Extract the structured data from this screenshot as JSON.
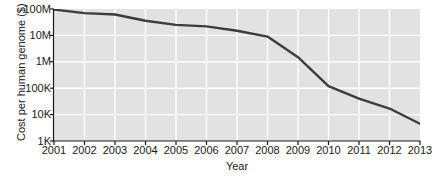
{
  "chart_data": {
    "type": "line",
    "title": "",
    "xlabel": "Year",
    "ylabel": "Cost per human genome ($)",
    "xlim": [
      2001,
      2013
    ],
    "ylim": [
      1000,
      100000000
    ],
    "yscale": "log",
    "grid": true,
    "legend": null,
    "x_tick_labels": [
      "2001",
      "2002",
      "2003",
      "2004",
      "2005",
      "2006",
      "2007",
      "2008",
      "2009",
      "2010",
      "2011",
      "2012",
      "2013"
    ],
    "x_tick_values": [
      2001,
      2002,
      2003,
      2004,
      2005,
      2006,
      2007,
      2008,
      2009,
      2010,
      2011,
      2012,
      2013
    ],
    "y_tick_labels": [
      "100M",
      "10M",
      "1M",
      "100K",
      "10K",
      "1K"
    ],
    "y_tick_values": [
      100000000,
      10000000,
      1000000,
      100000,
      10000,
      1000
    ],
    "line_color": "#3c3c3c",
    "plot_background": "#e2e2e2",
    "gridline_color": "#ffffff",
    "x": [
      2001,
      2002,
      2003,
      2004,
      2005,
      2006,
      2007,
      2008,
      2009,
      2010,
      2011,
      2012,
      2013
    ],
    "values": [
      95000000,
      70000000,
      62000000,
      36000000,
      25000000,
      22000000,
      15000000,
      9000000,
      1500000,
      120000,
      40000,
      17000,
      4500
    ],
    "series": [
      {
        "name": "Cost per human genome",
        "values": [
          95000000,
          70000000,
          62000000,
          36000000,
          25000000,
          22000000,
          15000000,
          9000000,
          1500000,
          120000,
          40000,
          17000,
          4500
        ]
      }
    ]
  },
  "axis": {
    "y_title": "Cost per human genome ($)",
    "x_title": "Year"
  }
}
